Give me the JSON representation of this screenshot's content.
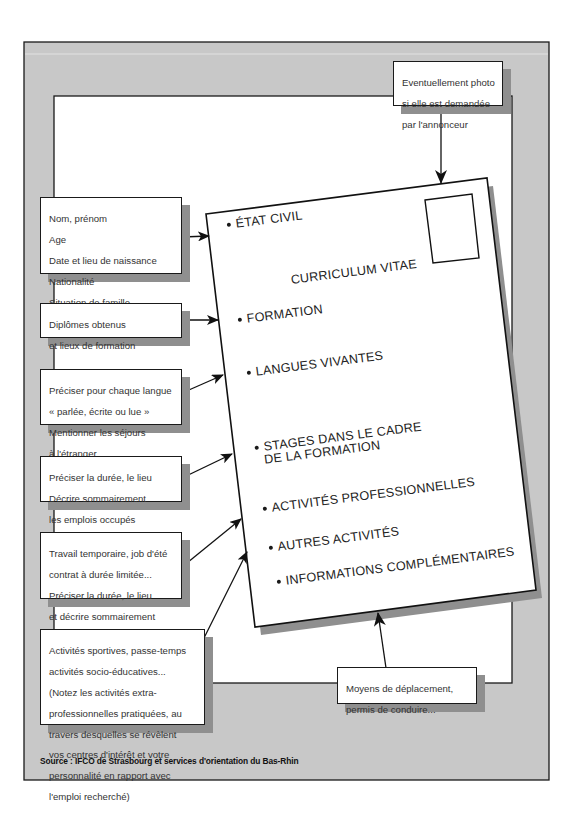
{
  "diagram": {
    "type": "annotated-document-layout",
    "colors": {
      "frame_gray": "#c8c8c8",
      "shadow_gray": "#8f8f8f",
      "line": "#1a1a1a",
      "paper": "#ffffff"
    }
  },
  "card": {
    "title": "CURRICULUM VITAE",
    "photo_box": "photo",
    "sections": [
      {
        "label": "ÉTAT CIVIL"
      },
      {
        "label": "FORMATION"
      },
      {
        "label": "LANGUES VIVANTES"
      },
      {
        "label_line1": "STAGES DANS LE CADRE",
        "label_line2": "DE LA FORMATION"
      },
      {
        "label": "ACTIVITÉS PROFESSIONNELLES"
      },
      {
        "label": "AUTRES ACTIVITÉS"
      },
      {
        "label": "INFORMATIONS COMPLÉMENTAIRES"
      }
    ]
  },
  "callouts": {
    "photo": {
      "lines": [
        "Eventuellement photo",
        "si elle est demandée",
        "par l'annonceur"
      ]
    },
    "etat_civil": {
      "lines": [
        "Nom, prénom",
        "Age",
        "Date et lieu de naissance",
        "Nationalité",
        "Situation de famille",
        "Adresse et n° de téléphone"
      ]
    },
    "formation": {
      "lines": [
        "Diplômes obtenus",
        "et lieux de formation"
      ]
    },
    "langues": {
      "lines": [
        "Préciser pour chaque langue",
        "« parlée, écrite ou lue »",
        "Mentionner les séjours",
        "à l'étranger"
      ]
    },
    "stages": {
      "lines": [
        "Préciser la durée, le lieu",
        "Décrire sommairement",
        "les emplois occupés"
      ]
    },
    "activites_pro": {
      "lines": [
        "Travail temporaire, job d'été",
        "contrat à durée limitée...",
        "Préciser la durée, le lieu",
        "et décrire sommairement",
        "les emplois occupés"
      ]
    },
    "autres": {
      "lines": [
        "Activités sportives, passe-temps",
        "activités socio-éducatives...",
        "(Notez les activités extra-",
        "professionnelles pratiquées, au",
        "travers desquelles se révèlent",
        "vos centres d'intérêt et votre",
        "personnalité en rapport avec",
        "l'emploi recherché)"
      ]
    },
    "complementaires": {
      "lines": [
        "Moyens de déplacement,",
        "permis de conduire..."
      ]
    }
  },
  "footer": {
    "source": "Source : IFCO de Strasbourg et services d'orientation du Bas-Rhin"
  }
}
